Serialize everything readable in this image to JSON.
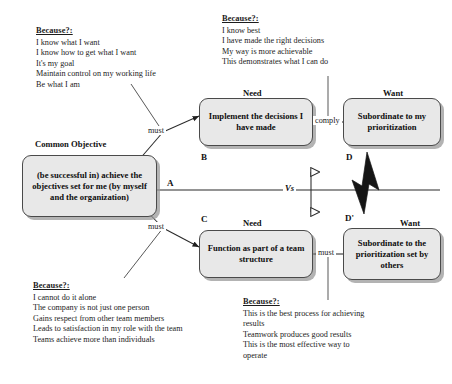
{
  "diagram": {
    "common_objective_label": "Common Objective",
    "need_label_top": "Need",
    "need_label_bottom": "Need",
    "want_label_top": "Want",
    "want_label_bottom": "Want",
    "vs_label": "Vs"
  },
  "boxes": {
    "a": {
      "letter": "A",
      "text": "(be successful in) achieve the objectives set for me (by myself and the organization)"
    },
    "b": {
      "letter": "B",
      "text": "Implement the decisions I have made"
    },
    "c": {
      "letter": "C",
      "text": "Function as part of a team structure"
    },
    "d": {
      "letter": "D",
      "text": "Subordinate to my prioritization"
    },
    "dprime": {
      "letter": "D'",
      "text": "Subordinate to the prioritization set by others"
    }
  },
  "edges": {
    "must_ab": "must",
    "must_ac": "must",
    "comply_bd": "comply",
    "must_cdprime": "must"
  },
  "assumptions": {
    "top_left": {
      "heading": "Because?:",
      "lines": [
        "I know what I want",
        "I know how to get what I want",
        "It's my goal",
        "Maintain control on my working life",
        "Be what I am"
      ]
    },
    "top_right": {
      "heading": "Because?:",
      "lines": [
        "I know best",
        "I have made the right decisions",
        "My way is more achievable",
        "This demonstrates what I can do"
      ]
    },
    "bottom_left": {
      "heading": "Because?:",
      "lines": [
        "I cannot do it alone",
        "The company is not just one person",
        "Gains respect from other team members",
        "Leads to satisfaction in my role with the team",
        "Teams achieve more than individuals"
      ]
    },
    "bottom_right": {
      "heading": "Because?:",
      "lines": [
        "This is the best process for achieving results",
        "Teamwork produces good results",
        "This is the most effective way to operate"
      ]
    }
  },
  "colors": {
    "box_fill": "#e8e8e8",
    "box_border": "#4a4a4a",
    "shadow": "#969696",
    "conflict_bolt": "#151515",
    "background": "#ffffff",
    "text": "#1a1a1a"
  }
}
